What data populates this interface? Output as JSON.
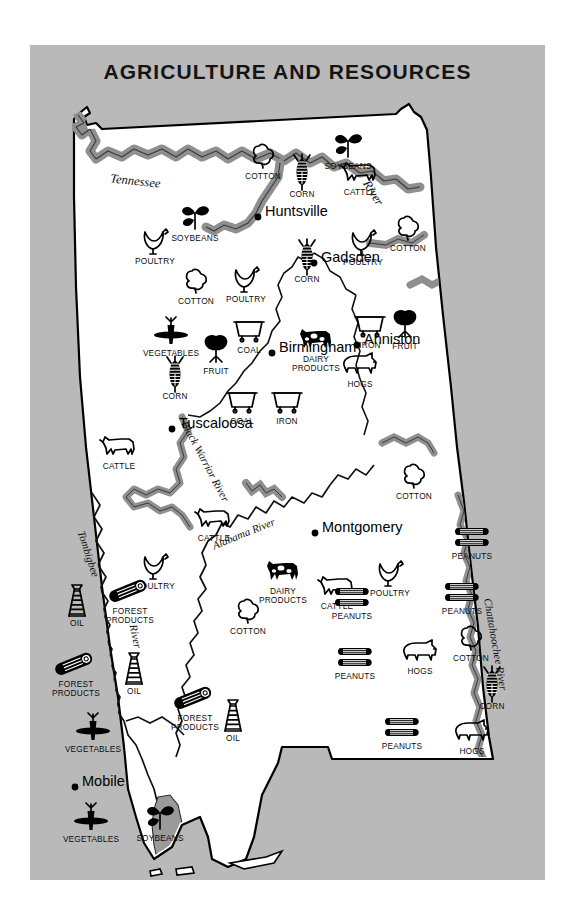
{
  "title": "AGRICULTURE AND RESOURCES",
  "colors": {
    "panel_background": "#b9b9b9",
    "page_background": "#ffffff",
    "state_fill": "#ffffff",
    "river_fill": "#9a9a9a",
    "ink": "#000000"
  },
  "cities": [
    {
      "name": "Huntsville",
      "x": 228,
      "y": 172
    },
    {
      "name": "Gadsden",
      "x": 284,
      "y": 218
    },
    {
      "name": "Birmingham",
      "x": 242,
      "y": 308
    },
    {
      "name": "Anniston",
      "x": 327,
      "y": 300
    },
    {
      "name": "Tuscaloosa",
      "x": 142,
      "y": 384
    },
    {
      "name": "Montgomery",
      "x": 285,
      "y": 488
    },
    {
      "name": "Mobile",
      "x": 45,
      "y": 742
    }
  ],
  "rivers": [
    {
      "name": "Tennessee",
      "x": 105,
      "y": 132
    },
    {
      "name": "River",
      "x": 340,
      "y": 133
    },
    {
      "name": "Black Warrior River",
      "x": 148,
      "y": 425
    },
    {
      "name": "Tombigbee",
      "x": 48,
      "y": 520
    },
    {
      "name": "River",
      "x": 96,
      "y": 600
    },
    {
      "name": "Alabama River",
      "x": 200,
      "y": 500
    },
    {
      "name": "Chattahoochee River",
      "x": 458,
      "y": 620
    }
  ],
  "resources": [
    {
      "label": "COTTON",
      "icon": "cotton-boll-icon",
      "x": 233,
      "y": 110
    },
    {
      "label": "SOYBEANS",
      "icon": "soybean-plant-icon",
      "x": 318,
      "y": 100
    },
    {
      "label": "CORN",
      "icon": "corn-ear-icon",
      "x": 272,
      "y": 128
    },
    {
      "label": "CATTLE",
      "icon": "cattle-icon",
      "x": 330,
      "y": 126
    },
    {
      "label": "SOYBEANS",
      "icon": "soybean-plant-icon",
      "x": 165,
      "y": 172
    },
    {
      "label": "POULTRY",
      "icon": "chicken-icon",
      "x": 125,
      "y": 195
    },
    {
      "label": "CORN",
      "icon": "corn-ear-icon",
      "x": 277,
      "y": 213
    },
    {
      "label": "POULTRY",
      "icon": "chicken-icon",
      "x": 333,
      "y": 196
    },
    {
      "label": "COTTON",
      "icon": "cotton-boll-icon",
      "x": 378,
      "y": 182
    },
    {
      "label": "COTTON",
      "icon": "cotton-boll-icon",
      "x": 166,
      "y": 235
    },
    {
      "label": "POULTRY",
      "icon": "chicken-icon",
      "x": 216,
      "y": 233
    },
    {
      "label": "VEGETABLES",
      "icon": "carrot-icon",
      "x": 141,
      "y": 287
    },
    {
      "label": "FRUIT",
      "icon": "fruit-tree-icon",
      "x": 186,
      "y": 305
    },
    {
      "label": "COAL",
      "icon": "coal-car-icon",
      "x": 219,
      "y": 284
    },
    {
      "label": "DAIRY PRODUCTS",
      "icon": "dairy-cow-icon",
      "x": 286,
      "y": 293
    },
    {
      "label": "IRON",
      "icon": "ore-car-icon",
      "x": 340,
      "y": 279
    },
    {
      "label": "FRUIT",
      "icon": "fruit-tree-icon",
      "x": 375,
      "y": 280
    },
    {
      "label": "HOGS",
      "icon": "hog-icon",
      "x": 330,
      "y": 318
    },
    {
      "label": "CORN",
      "icon": "corn-ear-icon",
      "x": 145,
      "y": 330
    },
    {
      "label": "COAL",
      "icon": "coal-car-icon",
      "x": 212,
      "y": 355
    },
    {
      "label": "IRON",
      "icon": "ore-car-icon",
      "x": 257,
      "y": 355
    },
    {
      "label": "CATTLE",
      "icon": "cattle-icon",
      "x": 89,
      "y": 400
    },
    {
      "label": "COTTON",
      "icon": "cotton-boll-icon",
      "x": 384,
      "y": 430
    },
    {
      "label": "CATTLE",
      "icon": "cattle-icon",
      "x": 184,
      "y": 472
    },
    {
      "label": "POULTRY",
      "icon": "chicken-icon",
      "x": 125,
      "y": 520
    },
    {
      "label": "DAIRY PRODUCTS",
      "icon": "dairy-cow-icon",
      "x": 253,
      "y": 525
    },
    {
      "label": "CATTLE",
      "icon": "cattle-icon",
      "x": 307,
      "y": 540
    },
    {
      "label": "PEANUTS",
      "icon": "peanut-icon",
      "x": 442,
      "y": 490
    },
    {
      "label": "POULTRY",
      "icon": "chicken-icon",
      "x": 360,
      "y": 527
    },
    {
      "label": "PEANUTS",
      "icon": "peanut-icon",
      "x": 322,
      "y": 550
    },
    {
      "label": "PEANUTS",
      "icon": "peanut-icon",
      "x": 432,
      "y": 545
    },
    {
      "label": "COTTON",
      "icon": "cotton-boll-icon",
      "x": 218,
      "y": 565
    },
    {
      "label": "PEANUTS",
      "icon": "peanut-icon",
      "x": 325,
      "y": 610
    },
    {
      "label": "HOGS",
      "icon": "hog-icon",
      "x": 390,
      "y": 605
    },
    {
      "label": "COTTON",
      "icon": "cotton-boll-icon",
      "x": 441,
      "y": 592
    },
    {
      "label": "CORN",
      "icon": "corn-ear-icon",
      "x": 462,
      "y": 640
    },
    {
      "label": "PEANUTS",
      "icon": "peanut-icon",
      "x": 372,
      "y": 680
    },
    {
      "label": "HOGS",
      "icon": "hog-icon",
      "x": 442,
      "y": 685
    },
    {
      "label": "OIL",
      "icon": "oil-derrick-icon",
      "x": 47,
      "y": 557
    },
    {
      "label": "FOREST PRODUCTS",
      "icon": "log-icon",
      "x": 100,
      "y": 545
    },
    {
      "label": "OIL",
      "icon": "oil-derrick-icon",
      "x": 104,
      "y": 625
    },
    {
      "label": "FOREST PRODUCTS",
      "icon": "log-icon",
      "x": 46,
      "y": 618
    },
    {
      "label": "FOREST PRODUCTS",
      "icon": "log-icon",
      "x": 165,
      "y": 652
    },
    {
      "label": "OIL",
      "icon": "oil-derrick-icon",
      "x": 203,
      "y": 672
    },
    {
      "label": "VEGETABLES",
      "icon": "carrot-icon",
      "x": 63,
      "y": 683
    },
    {
      "label": "VEGETABLES",
      "icon": "carrot-icon",
      "x": 61,
      "y": 773
    },
    {
      "label": "SOYBEANS",
      "icon": "soybean-plant-icon",
      "x": 130,
      "y": 772
    }
  ]
}
